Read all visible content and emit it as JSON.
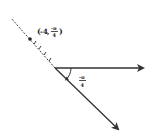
{
  "diagram": {
    "type": "polar-coordinate-plot",
    "point_label": {
      "open": "(",
      "r": "-4",
      "sep": ",",
      "theta_num": "-π",
      "theta_den": "4",
      "close": ")"
    },
    "angle_label": {
      "num": "-π",
      "den": "4"
    },
    "colors": {
      "stroke": "#333333",
      "background": "#ffffff"
    },
    "tick_count": 4
  }
}
